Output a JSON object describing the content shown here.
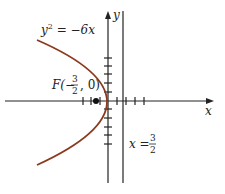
{
  "diagram": {
    "type": "parabola-graph",
    "equation_label": {
      "base": "y",
      "exp": "2",
      "rhs": " = −6x"
    },
    "focus_label": {
      "prefix": "F(−",
      "num": "3",
      "den": "2",
      "suffix": ", 0)"
    },
    "directrix_label": {
      "prefix": "x = ",
      "num": "3",
      "den": "2"
    },
    "x_axis_label": "x",
    "y_axis_label": "y",
    "colors": {
      "curve": "#8b3a1e",
      "axes": "#222222"
    }
  }
}
